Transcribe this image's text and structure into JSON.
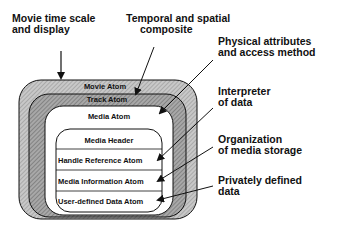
{
  "diagram": {
    "callouts": [
      {
        "id": "movie-time",
        "text_line1": "Movie time scale",
        "text_line2": "and display",
        "points_to": "Movie Atom"
      },
      {
        "id": "temporal",
        "text_line1": "Temporal and spatial",
        "text_line2": "composite",
        "points_to": "Track Atom"
      },
      {
        "id": "physical",
        "text_line1": "Physical attributes",
        "text_line2": "and access method",
        "points_to": "Media Atom"
      },
      {
        "id": "interpreter",
        "text_line1": "Interpreter",
        "text_line2": "of data",
        "points_to": "Handle Reference Atom"
      },
      {
        "id": "organization",
        "text_line1": "Organization",
        "text_line2": "of media storage",
        "points_to": "Media Information Atom"
      },
      {
        "id": "private",
        "text_line1": "Privately defined",
        "text_line2": "data",
        "points_to": "User-defined Data Atom"
      }
    ],
    "atoms": {
      "movie": "Movie Atom",
      "track": "Track Atom",
      "media": "Media Atom",
      "media_header": "Media Header",
      "handle_reference": "Handle Reference Atom",
      "media_information": "Media Information Atom",
      "user_defined": "User-defined Data Atom"
    },
    "colors": {
      "movie_fill": "#bdbdbd",
      "track_fill": "#9a9a9a",
      "media_fill": "#ffffff",
      "stroke": "#111111"
    }
  }
}
